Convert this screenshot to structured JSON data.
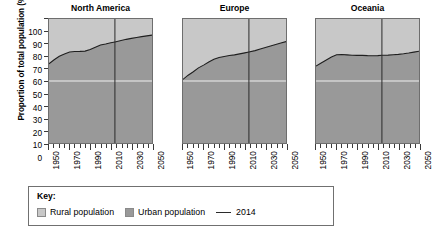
{
  "chart_data": {
    "type": "area",
    "title": "",
    "ylabel": "Proportion of total population (%)",
    "xlabel": "",
    "ylim": [
      0,
      100
    ],
    "xlim": [
      1950,
      2050
    ],
    "yticks": [
      0,
      10,
      20,
      30,
      40,
      50,
      60,
      70,
      80,
      90,
      100
    ],
    "xticks": [
      1950,
      1970,
      1990,
      2010,
      2030,
      2050
    ],
    "x_minor_step": 5,
    "grid": "single white horizontal gridline at 50%",
    "gridline_value": 50,
    "legend_position": "bottom",
    "reference_line_year": 2014,
    "colors": {
      "rural": "#c8c8c8",
      "urban": "#999999",
      "reference_line": "#2b2b2b",
      "gridline": "#f0f0f0",
      "axis": "#6e6e6e"
    },
    "x": [
      1950,
      1955,
      1960,
      1965,
      1970,
      1975,
      1980,
      1985,
      1990,
      1995,
      2000,
      2005,
      2010,
      2014,
      2020,
      2025,
      2030,
      2035,
      2040,
      2045,
      2050
    ],
    "panels": [
      {
        "title": "North America",
        "series_name": "Urban population",
        "values": [
          63.9,
          67.1,
          69.9,
          71.8,
          73.4,
          73.8,
          73.9,
          74.1,
          75.4,
          77.3,
          79.1,
          79.9,
          80.8,
          81.5,
          82.6,
          83.6,
          84.4,
          85.1,
          85.8,
          86.4,
          87.0
        ]
      },
      {
        "title": "Europe",
        "series_name": "Urban population",
        "values": [
          51.3,
          54.7,
          57.5,
          60.6,
          62.8,
          65.3,
          67.6,
          68.9,
          69.8,
          70.5,
          71.1,
          71.9,
          72.7,
          73.4,
          74.5,
          75.8,
          77.0,
          78.2,
          79.4,
          80.6,
          81.8
        ]
      },
      {
        "title": "Oceania",
        "series_name": "Urban population",
        "values": [
          62.0,
          64.5,
          67.0,
          69.3,
          71.2,
          71.4,
          71.1,
          70.8,
          70.7,
          70.7,
          70.5,
          70.4,
          70.5,
          70.8,
          70.9,
          71.2,
          71.5,
          72.0,
          72.6,
          73.3,
          74.0
        ]
      }
    ]
  },
  "axis": {
    "y_title": "Proportion of total population (%)",
    "y_tick_labels": [
      "100",
      "90",
      "80",
      "70",
      "60",
      "50",
      "40",
      "30",
      "20",
      "10",
      "0"
    ],
    "x_tick_labels": [
      "1950",
      "1970",
      "1990",
      "2010",
      "2030",
      "2050"
    ]
  },
  "panel_titles": {
    "north_america": "North America",
    "europe": "Europe",
    "oceania": "Oceania"
  },
  "key": {
    "title": "Key:",
    "rural_label": "Rural population",
    "urban_label": "Urban population",
    "reference_label": "2014"
  }
}
